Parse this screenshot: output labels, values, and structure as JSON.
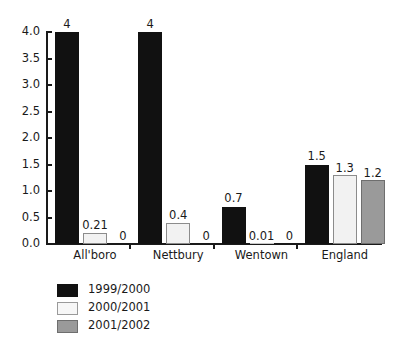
{
  "chart_data": {
    "type": "bar",
    "title": "",
    "subtitle": "",
    "xlabel": "",
    "ylabel": "",
    "ylim": [
      0,
      4.0
    ],
    "grid": false,
    "legend_position": "bottom-left",
    "categories": [
      "All'boro",
      "Nettbury",
      "Wentown",
      "England"
    ],
    "y_ticks": [
      "0.0",
      "0.5",
      "1.0",
      "1.5",
      "2.0",
      "2.5",
      "3.0",
      "3.5",
      "4.0"
    ],
    "y_tick_values": [
      0,
      0.5,
      1.0,
      1.5,
      2.0,
      2.5,
      3.0,
      3.5,
      4.0
    ],
    "series": [
      {
        "name": "1999/2000",
        "color": "#111111",
        "values": [
          4,
          4,
          0.7,
          1.5
        ],
        "labels": [
          "4",
          "4",
          "0.7",
          "1.5"
        ]
      },
      {
        "name": "2000/2001",
        "color": "#f2f2f2",
        "values": [
          0.21,
          0.4,
          0.01,
          1.3
        ],
        "labels": [
          "0.21",
          "0.4",
          "0.01",
          "1.3"
        ]
      },
      {
        "name": "2001/2002",
        "color": "#9a9a9a",
        "values": [
          0,
          0,
          0,
          1.2
        ],
        "labels": [
          "0",
          "0",
          "0",
          "1.2"
        ]
      }
    ]
  },
  "legend": {
    "items": [
      {
        "label": "1999/2000"
      },
      {
        "label": "2000/2001"
      },
      {
        "label": "2001/2002"
      }
    ]
  }
}
